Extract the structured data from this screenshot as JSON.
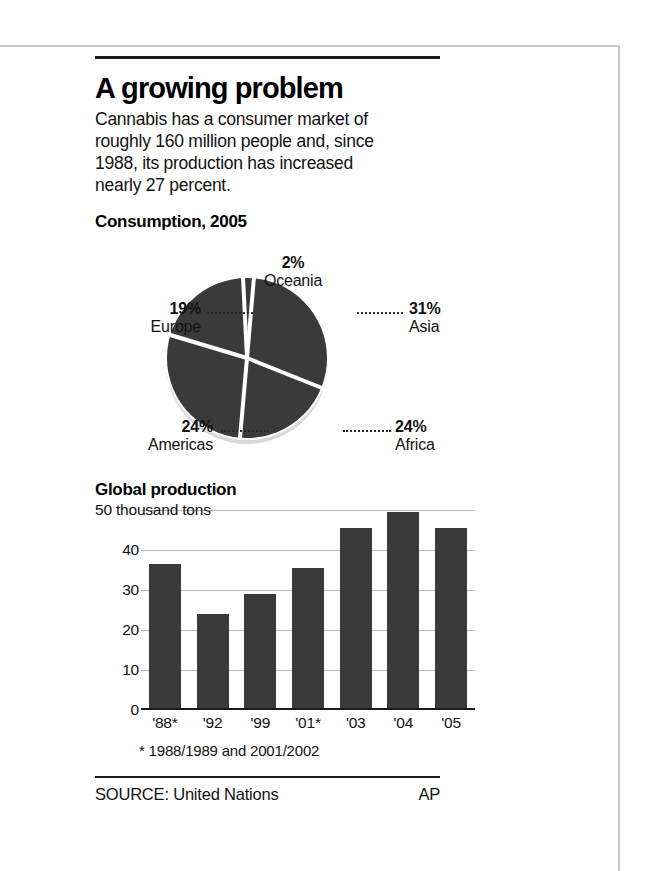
{
  "headline": "A growing problem",
  "deck": "Cannabis has a consumer market of roughly 160 million people and, since 1988, its production has increased nearly 27 percent.",
  "pie_section_title": "Consumption, 2005",
  "bar_section_title": "Global production",
  "footnote": "* 1988/1989 and 2001/2002",
  "source_label": "SOURCE: United Nations",
  "credit": "AP",
  "colors": {
    "ink": "#1b1b1b",
    "fill": "#3a3a3a",
    "grid": "#b4b4b4",
    "frame": "#c9c9c9",
    "paper": "#ffffff"
  },
  "chart_data": [
    {
      "type": "pie",
      "title": "Consumption, 2005",
      "unit": "percent",
      "legend_position": "callouts",
      "slices": [
        {
          "label": "Asia",
          "value": 31,
          "value_text": "31%"
        },
        {
          "label": "Africa",
          "value": 24,
          "value_text": "24%"
        },
        {
          "label": "Americas",
          "value": 24,
          "value_text": "24%"
        },
        {
          "label": "Europe",
          "value": 19,
          "value_text": "19%"
        },
        {
          "label": "Oceania",
          "value": 2,
          "value_text": "2%"
        }
      ]
    },
    {
      "type": "bar",
      "title": "Global production",
      "ylabel": "50 thousand tons",
      "unit_label": "thousand tons",
      "xlabel": "",
      "categories": [
        "'88*",
        "'92",
        "'99",
        "'01*",
        "'03",
        "'04",
        "'05"
      ],
      "values": [
        36.5,
        24,
        29,
        35.5,
        45.5,
        49.5,
        45.5
      ],
      "ylim": [
        0,
        50
      ],
      "yticks": [
        0,
        10,
        20,
        30,
        40,
        50
      ],
      "ytick_labels": [
        "0",
        "10",
        "20",
        "30",
        "40",
        "50 thousand tons"
      ],
      "grid": true,
      "note": "* 1988/1989 and 2001/2002"
    }
  ]
}
